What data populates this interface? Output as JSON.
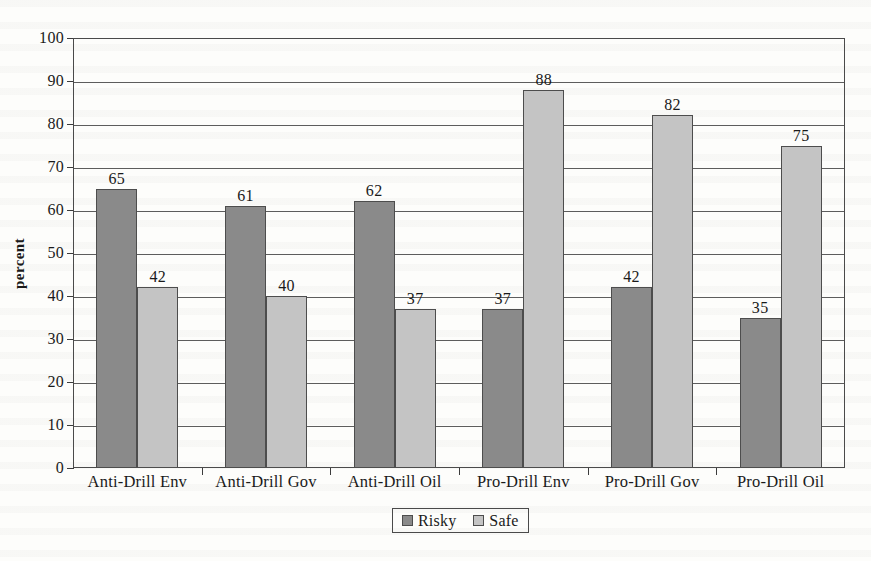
{
  "chart_data": {
    "type": "bar",
    "title": "",
    "xlabel": "",
    "ylabel": "percent",
    "ylim": [
      0,
      100
    ],
    "ytick_step": 10,
    "yticks": [
      0,
      10,
      20,
      30,
      40,
      50,
      60,
      70,
      80,
      90,
      100
    ],
    "grid": true,
    "legend_position": "bottom-center",
    "categories": [
      "Anti-Drill Env",
      "Anti-Drill Gov",
      "Anti-Drill Oil",
      "Pro-Drill Env",
      "Pro-Drill Gov",
      "Pro-Drill Oil"
    ],
    "series": [
      {
        "name": "Risky",
        "color": "#8a8a8a",
        "values": [
          65,
          61,
          62,
          37,
          42,
          35
        ]
      },
      {
        "name": "Safe",
        "color": "#c4c4c4",
        "values": [
          42,
          40,
          37,
          88,
          82,
          75
        ]
      }
    ]
  },
  "colors": {
    "risky": "#8a8a8a",
    "safe": "#c4c4c4",
    "axis": "#4a4a4a",
    "gridline": "#5d5d5d",
    "page_background": "#fdfdfb",
    "text": "#1a1a1a"
  }
}
